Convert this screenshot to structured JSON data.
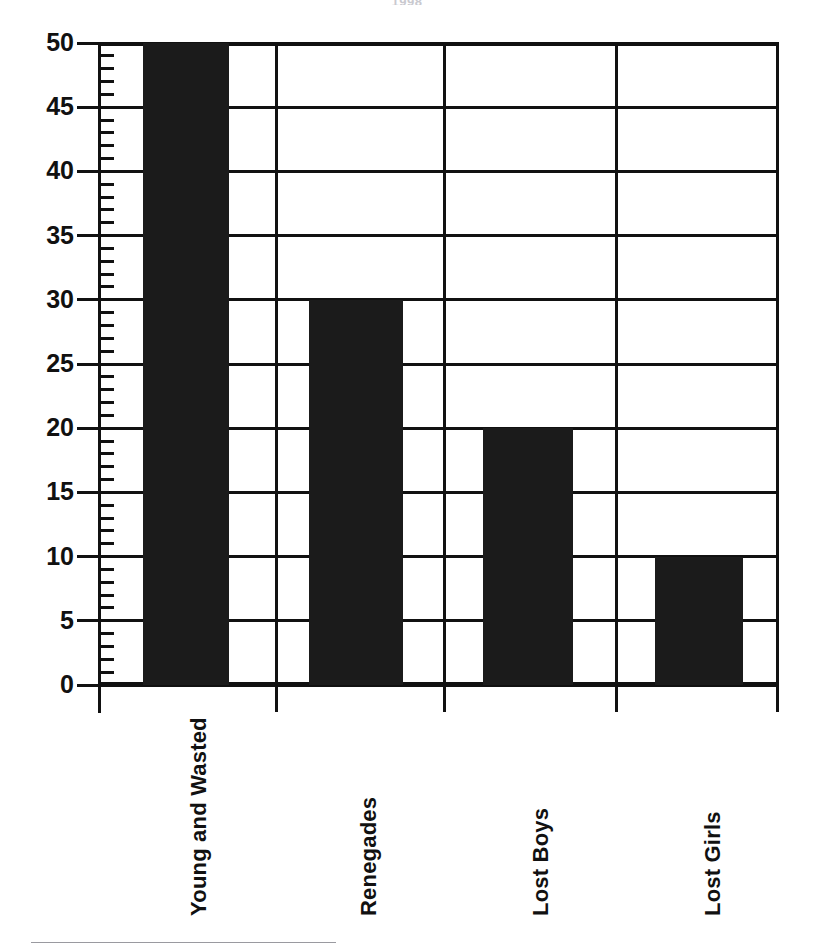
{
  "chart_data": {
    "type": "bar",
    "title": "1998",
    "categories": [
      "Young and Wasted",
      "Renegades",
      "Lost Boys",
      "Lost Girls"
    ],
    "values": [
      50,
      30,
      20,
      10
    ],
    "xlabel": "",
    "ylabel": "",
    "ylim": [
      0,
      50
    ],
    "y_ticks": [
      0,
      5,
      10,
      15,
      20,
      25,
      30,
      35,
      40,
      45,
      50
    ],
    "y_tick_labels": [
      "0",
      "5",
      "10",
      "15",
      "20",
      "25",
      "30",
      "35",
      "40",
      "45",
      "50"
    ],
    "minor_tick_interval": 1,
    "grid": "horizontal-and-category-separators",
    "legend": "none",
    "bar_color": "#1b1b1b",
    "axis_color": "#111111",
    "background_color": "#ffffff"
  },
  "footer": {
    "rule_color": "#9a9aa0"
  }
}
